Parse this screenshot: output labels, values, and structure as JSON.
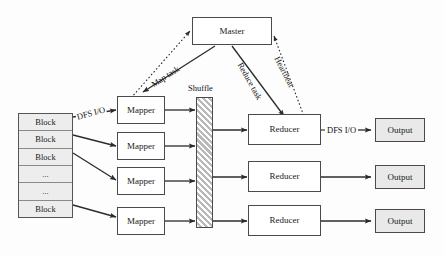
{
  "diagram": {
    "type": "flow-diagram",
    "background_color": "#fdfdfd",
    "stroke_color": "#3a3a3a",
    "fill_plain": "#ffffff",
    "fill_shaded": "#e9e9e9",
    "shuffle_fill": "#d2d2d2"
  },
  "input_stack": {
    "name": "input-block-stack",
    "rows": [
      {
        "label": "Block"
      },
      {
        "label": "Block"
      },
      {
        "label": "Block"
      },
      {
        "label": "..."
      },
      {
        "label": "..."
      },
      {
        "label": "Block"
      }
    ]
  },
  "master": {
    "label": "Master"
  },
  "mappers": [
    {
      "label": "Mapper"
    },
    {
      "label": "Mapper"
    },
    {
      "label": "Mapper"
    },
    {
      "label": "Mapper"
    }
  ],
  "shuffle": {
    "label": "Shuffle"
  },
  "reducers": [
    {
      "label": "Reducer"
    },
    {
      "label": "Reducer"
    },
    {
      "label": "Reducer"
    }
  ],
  "outputs": [
    {
      "label": "Output"
    },
    {
      "label": "Output"
    },
    {
      "label": "Output"
    }
  ],
  "edge_labels": {
    "dfs_io_in": "DFS I/O",
    "dfs_io_out": "DFS I/O",
    "map_task": "Map task",
    "reduce_task": "Reduce task",
    "heartbeat": "Heartbeat"
  }
}
